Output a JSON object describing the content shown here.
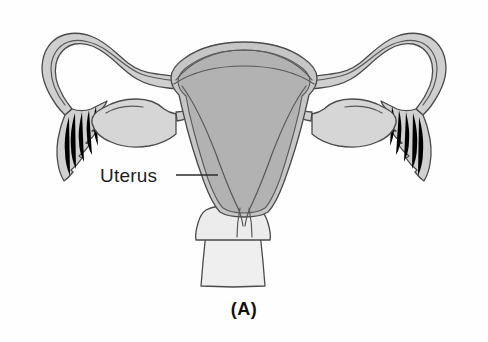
{
  "figure": {
    "kind": "anatomical-diagram",
    "background_color": "#fefefe",
    "caption": "(A)",
    "label": "Uterus"
  },
  "labels": [
    {
      "id": "uterus",
      "text": "Uterus",
      "text_x": 100,
      "text_y": 182,
      "leader_x1": 176,
      "leader_y1": 175,
      "leader_x2": 218,
      "leader_y2": 175
    }
  ],
  "caption": {
    "text": "(A)",
    "x": 244,
    "y": 315
  },
  "colors": {
    "uterus_body_fill": "#b2b2b2",
    "uterus_wall_fill": "#c9c9c9",
    "uterus_outline": "#4a4a4a",
    "tube_fill": "#cfcfcf",
    "ovary_fill": "#d6d6d6",
    "fimbriae_fill": "#d0d0d0",
    "cervix_vagina_fill": "#eeeeee",
    "background": "#fefefe",
    "label_text": "#1e1e1e",
    "caption_text": "#111111",
    "leader_line": "#2b2b2b"
  },
  "structures": [
    {
      "id": "left-fallopian-tube",
      "name": "Left fallopian tube",
      "side": "left"
    },
    {
      "id": "left-fimbriae",
      "name": "Left fimbriae",
      "side": "left"
    },
    {
      "id": "left-ovary",
      "name": "Left ovary",
      "side": "left"
    },
    {
      "id": "right-fallopian-tube",
      "name": "Right fallopian tube",
      "side": "right"
    },
    {
      "id": "right-fimbriae",
      "name": "Right fimbriae",
      "side": "right"
    },
    {
      "id": "right-ovary",
      "name": "Right ovary",
      "side": "right"
    },
    {
      "id": "uterus-body",
      "name": "Uterus body",
      "side": "center"
    },
    {
      "id": "uterine-cavity",
      "name": "Uterine cavity",
      "side": "center"
    },
    {
      "id": "fundus",
      "name": "Fundus of uterus",
      "side": "center"
    },
    {
      "id": "cervix",
      "name": "Cervix",
      "side": "center"
    },
    {
      "id": "vagina",
      "name": "Vagina",
      "side": "center"
    }
  ]
}
